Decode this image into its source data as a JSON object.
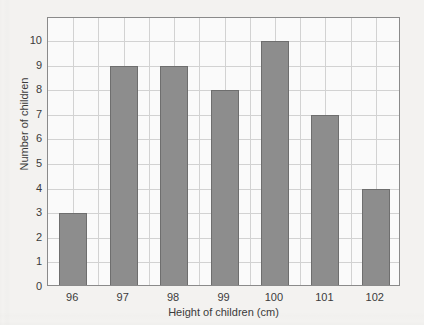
{
  "chart_data": {
    "type": "bar",
    "title": "",
    "xlabel": "Height of children (cm)",
    "ylabel": "Number of children",
    "categories": [
      "96",
      "97",
      "98",
      "99",
      "100",
      "101",
      "102"
    ],
    "values": [
      3,
      9,
      9,
      8,
      10,
      7,
      4
    ],
    "ylim": [
      0,
      10
    ],
    "ytick_labels": [
      "0",
      "1",
      "2",
      "3",
      "4",
      "5",
      "6",
      "7",
      "8",
      "9",
      "10"
    ],
    "grid": true,
    "legend": false,
    "colors": {
      "bar_fill": "#8d8d8d",
      "bar_edge": "#6e6e6e",
      "gridline": "#d2d2d2",
      "axis": "#8a8a8a",
      "text": "#3b3b3b",
      "plot_background": "#fafafa",
      "page_background": "#f3f2f0"
    }
  }
}
